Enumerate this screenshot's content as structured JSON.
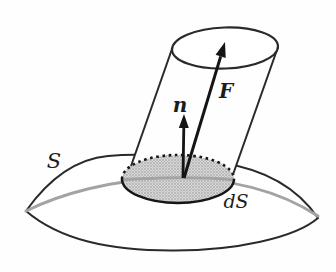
{
  "figure": {
    "name": "flux-through-surface-element-diagram",
    "labels": {
      "surface": "S",
      "surface_element": "dS",
      "normal_vector": "n",
      "field_vector": "F"
    },
    "colors": {
      "background": "#fefefe",
      "outline": "#2a2a2a",
      "rim_gray": "#a3a3a3",
      "edge_black": "#161616",
      "arrow": "#141414",
      "stipple_bg": "#d7d7d7",
      "stipple_dot": "#8e8e8e",
      "cylinder_fill": "#fefefe"
    }
  }
}
